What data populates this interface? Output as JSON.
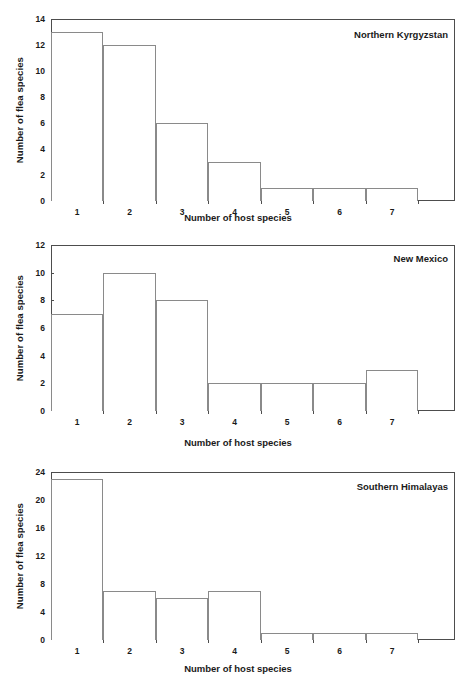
{
  "figure": {
    "background": "#ffffff",
    "axis_color": "#4d4d4d",
    "bar_edge_color": "#8a8a8a",
    "bar_fill_color": "#ffffff"
  },
  "chart_data": [
    {
      "type": "bar",
      "title": "Northern Kyrgyzstan",
      "xlabel": "Number of host species",
      "ylabel": "Number of flea species",
      "categories": [
        "1",
        "2",
        "3",
        "4",
        "5",
        "6",
        "7"
      ],
      "values": [
        13,
        12,
        6,
        3,
        1,
        1,
        1
      ],
      "ylim": [
        0,
        14
      ],
      "ytick_step": 2,
      "yticks": [
        "0",
        "2",
        "4",
        "6",
        "8",
        "10",
        "12",
        "14"
      ],
      "xlim": [
        0.5,
        8.2
      ],
      "grid": false,
      "legend": "none"
    },
    {
      "type": "bar",
      "title": "New Mexico",
      "xlabel": "Number of host species",
      "ylabel": "Number of flea species",
      "categories": [
        "1",
        "2",
        "3",
        "4",
        "5",
        "6",
        "7"
      ],
      "values": [
        7,
        10,
        8,
        2,
        2,
        2,
        3
      ],
      "ylim": [
        0,
        12
      ],
      "ytick_step": 2,
      "yticks": [
        "0",
        "2",
        "4",
        "6",
        "8",
        "10",
        "12"
      ],
      "xlim": [
        0.5,
        8.2
      ],
      "grid": false,
      "legend": "none"
    },
    {
      "type": "bar",
      "title": "Southern Himalayas",
      "xlabel": "Number of host species",
      "ylabel": "Number of flea species",
      "categories": [
        "1",
        "2",
        "3",
        "4",
        "5",
        "6",
        "7"
      ],
      "values": [
        23,
        7,
        6,
        7,
        1,
        1,
        1
      ],
      "ylim": [
        0,
        24
      ],
      "ytick_step": 4,
      "yticks": [
        "0",
        "4",
        "8",
        "12",
        "16",
        "20",
        "24"
      ],
      "xlim": [
        0.5,
        8.2
      ],
      "grid": false,
      "legend": "none"
    }
  ]
}
